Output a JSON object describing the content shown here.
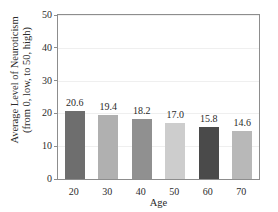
{
  "chart_data": {
    "type": "bar",
    "title": "",
    "categories": [
      "20",
      "30",
      "40",
      "50",
      "60",
      "70"
    ],
    "values": [
      20.6,
      19.4,
      18.2,
      17.0,
      15.8,
      14.6
    ],
    "value_labels": [
      "20.6",
      "19.4",
      "18.2",
      "17.0",
      "15.8",
      "14.6"
    ],
    "bar_colors": [
      "#6e6e6e",
      "#b0b0b0",
      "#909090",
      "#cdcdcd",
      "#4a4a4a",
      "#b8b8b8"
    ],
    "xlabel": "Age",
    "ylabel_line1": "Average Level of Neuroticism",
    "ylabel_line2": "(from 0, low, to 50, high)",
    "ylim": [
      0,
      50
    ],
    "yticks": [
      0,
      10,
      20,
      30,
      40,
      50
    ],
    "ytick_labels": [
      "0",
      "10",
      "20",
      "30",
      "40",
      "50"
    ],
    "xtick_labels": [
      "20",
      "30",
      "40",
      "50",
      "60",
      "70"
    ],
    "grid": true,
    "legend": "none",
    "axis_color": "#8d8d8d",
    "grid_color": "#efefef",
    "text_color": "#2b2b2b"
  }
}
